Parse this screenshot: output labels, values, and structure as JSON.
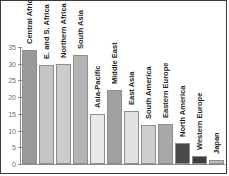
{
  "chart_data": {
    "type": "bar",
    "title": "",
    "subtitle": "",
    "xlabel": "",
    "ylabel": "",
    "ylim": [
      0,
      35
    ],
    "yticks": [
      0,
      5,
      10,
      15,
      20,
      25,
      30,
      35
    ],
    "ytick_labels": [
      "0",
      "5",
      "10",
      "15",
      "20",
      "25",
      "30",
      "35"
    ],
    "grid": false,
    "legend": "none",
    "orientation": "vertical",
    "label_placement": "rotated-vertical-above-bar",
    "categories": [
      "Central Africa",
      "E. and S. Africa",
      "Northern Africa",
      "South Asia",
      "Asia-Pacific",
      "Middle East",
      "East Asia",
      "South America",
      "Eastern Europe",
      "North America",
      "Western Europe",
      "Japan"
    ],
    "values": [
      34.1,
      29.7,
      30.0,
      32.7,
      14.9,
      22.2,
      15.8,
      11.7,
      12.0,
      6.3,
      2.4,
      1.2
    ],
    "bar_colors": [
      "#9a9a9a",
      "#c4c4c4",
      "#cccccc",
      "#b4b4b4",
      "#e8e8e8",
      "#a0a0a0",
      "#e2e2e2",
      "#cfcfcf",
      "#a8a8a8",
      "#4a4a4a",
      "#3c3c3c",
      "#bdbdbd"
    ],
    "axis_color": "#8a8a8a",
    "tick_label_color": "#6e6e6e",
    "category_label_color": "#1d1d1d",
    "background_color": "#ffffff",
    "border_color": "#3a3a3a"
  }
}
